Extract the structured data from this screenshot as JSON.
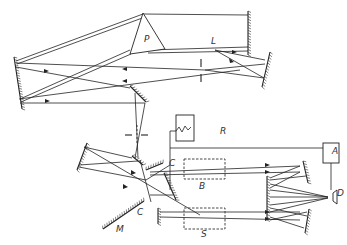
{
  "diagram": {
    "labels": [
      {
        "id": "P",
        "text": "P",
        "x": 144,
        "y": 42,
        "meaning": "prism"
      },
      {
        "id": "L",
        "text": "L",
        "x": 211,
        "y": 44,
        "meaning": "light source"
      },
      {
        "id": "R",
        "text": "R",
        "x": 220,
        "y": 134,
        "meaning": "recorder"
      },
      {
        "id": "C1",
        "text": "C",
        "x": 169,
        "y": 166,
        "meaning": "chopper"
      },
      {
        "id": "C2",
        "text": "C",
        "x": 137,
        "y": 215,
        "meaning": "chopper"
      },
      {
        "id": "B",
        "text": "B",
        "x": 199,
        "y": 189,
        "meaning": "reference cell"
      },
      {
        "id": "S",
        "text": "S",
        "x": 201,
        "y": 237,
        "meaning": "sample cell"
      },
      {
        "id": "A",
        "text": "A",
        "x": 332,
        "y": 154,
        "meaning": "amplifier"
      },
      {
        "id": "D",
        "text": "D",
        "x": 337,
        "y": 196,
        "meaning": "detector"
      },
      {
        "id": "M",
        "text": "M",
        "x": 116,
        "y": 232,
        "meaning": "mirror"
      }
    ],
    "mirrors": [
      {
        "name": "left-collimator-mirror",
        "x1": 14,
        "y1": 57,
        "x2": 22,
        "y2": 109
      },
      {
        "name": "littrow-mirror",
        "x1": 248,
        "y1": 11,
        "x2": 248,
        "y2": 55
      },
      {
        "name": "source-mirror",
        "x1": 270,
        "y1": 52,
        "x2": 262,
        "y2": 87
      },
      {
        "name": "fold-mirror-1",
        "x1": 130,
        "y1": 86,
        "x2": 146,
        "y2": 102
      },
      {
        "name": "slit-mirror-left",
        "x1": 87,
        "y1": 143,
        "x2": 77,
        "y2": 170
      },
      {
        "name": "fold-mirror-2",
        "x1": 132,
        "y1": 156,
        "x2": 143,
        "y2": 165
      },
      {
        "name": "beam-splitter-mirror",
        "x1": 146,
        "y1": 170,
        "x2": 163,
        "y2": 163
      },
      {
        "name": "lower-mirror",
        "x1": 158,
        "y1": 208,
        "x2": 158,
        "y2": 224
      },
      {
        "name": "diag-mirror-right",
        "x1": 164,
        "y1": 173,
        "x2": 176,
        "y2": 200
      },
      {
        "name": "mirror-M",
        "x1": 103,
        "y1": 229,
        "x2": 144,
        "y2": 201
      },
      {
        "name": "recombine-top",
        "x1": 303,
        "y1": 161,
        "x2": 308,
        "y2": 183
      },
      {
        "name": "recombine-mid",
        "x1": 267,
        "y1": 176,
        "x2": 267,
        "y2": 220
      },
      {
        "name": "recombine-bottom",
        "x1": 309,
        "y1": 209,
        "x2": 305,
        "y2": 233
      }
    ],
    "rays": [
      [
        16,
        61,
        143,
        14
      ],
      [
        17,
        64,
        145,
        17
      ],
      [
        143,
        14,
        248,
        15
      ],
      [
        148,
        50,
        248,
        47
      ],
      [
        148,
        53,
        248,
        51
      ],
      [
        20,
        99,
        130,
        50
      ],
      [
        21,
        102,
        131,
        54
      ],
      [
        16,
        63,
        205,
        70
      ],
      [
        19,
        99,
        240,
        70
      ],
      [
        16,
        67,
        130,
        88
      ],
      [
        20,
        103,
        145,
        103
      ],
      [
        205,
        70,
        265,
        64
      ],
      [
        205,
        70,
        264,
        78
      ],
      [
        215,
        50,
        265,
        60
      ],
      [
        215,
        50,
        264,
        78
      ],
      [
        135,
        93,
        138,
        158
      ],
      [
        145,
        103,
        135,
        158
      ],
      [
        84,
        147,
        132,
        158
      ],
      [
        79,
        165,
        138,
        161
      ],
      [
        84,
        147,
        200,
        215
      ],
      [
        79,
        167,
        146,
        180
      ],
      [
        140,
        160,
        151,
        202
      ],
      [
        146,
        180,
        170,
        165
      ],
      [
        150,
        172,
        300,
        166
      ],
      [
        150,
        175,
        300,
        172
      ],
      [
        150,
        195,
        173,
        195
      ],
      [
        160,
        212,
        300,
        212
      ],
      [
        160,
        217,
        300,
        220
      ],
      [
        300,
        166,
        270,
        178
      ],
      [
        300,
        172,
        270,
        188
      ],
      [
        306,
        176,
        270,
        180
      ],
      [
        270,
        184,
        328,
        197
      ],
      [
        270,
        190,
        328,
        197
      ],
      [
        270,
        197,
        328,
        197
      ],
      [
        270,
        205,
        328,
        198
      ],
      [
        270,
        212,
        328,
        198
      ],
      [
        270,
        208,
        307,
        216
      ],
      [
        270,
        217,
        304,
        228
      ],
      [
        270,
        220,
        307,
        212
      ]
    ],
    "components": {
      "prism": {
        "points": "143,13 165,49 130,54"
      },
      "slit_upper": {
        "x": 201,
        "y1": 59,
        "y2": 82
      },
      "slit_lower_h": {
        "x1": 125,
        "x2": 148,
        "y": 135
      },
      "recorder_box": {
        "x": 176,
        "y": 115,
        "w": 18,
        "h": 26
      },
      "amplifier_box": {
        "x": 323,
        "y": 143,
        "w": 16,
        "h": 20
      },
      "detector": {
        "x": 330,
        "y": 190,
        "w": 7,
        "h": 14
      },
      "cell_B": {
        "x": 184,
        "y": 159,
        "w": 41,
        "h": 20
      },
      "cell_S": {
        "x": 184,
        "y": 208,
        "w": 41,
        "h": 21
      }
    }
  }
}
